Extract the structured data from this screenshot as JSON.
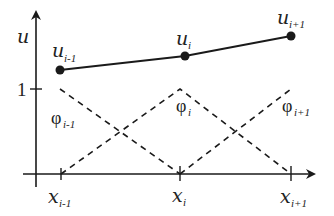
{
  "diagram": {
    "axes": {
      "y_label": "u",
      "y_tick_label": "1",
      "x_ticks": [
        {
          "base": "x",
          "sub": "i-1"
        },
        {
          "base": "x",
          "sub": "i"
        },
        {
          "base": "x",
          "sub": "i+1"
        }
      ]
    },
    "nodes": [
      {
        "base": "u",
        "sub": "i-1"
      },
      {
        "base": "u",
        "sub": "i"
      },
      {
        "base": "u",
        "sub": "i+1"
      }
    ],
    "basis_functions": [
      {
        "base": "φ",
        "sub": "i-1"
      },
      {
        "base": "φ",
        "sub": "i"
      },
      {
        "base": "φ",
        "sub": "i+1"
      }
    ],
    "colors": {
      "line": "#1a1a1a",
      "background": "#ffffff"
    }
  }
}
